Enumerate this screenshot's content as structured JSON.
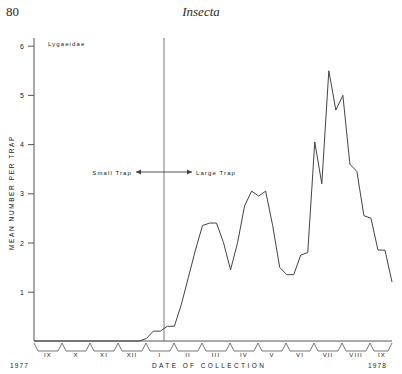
{
  "page": {
    "number": "80",
    "running_head": "Insecta"
  },
  "chart_data": {
    "type": "line",
    "title": "",
    "series_label": "Lygaeidae",
    "xlabel": "DATE OF COLLECTION",
    "ylabel": "MEAN NUMBER PER TRAP",
    "ylim": [
      0,
      6.3
    ],
    "y_ticks": [
      "1",
      "2",
      "3",
      "4",
      "5",
      "6"
    ],
    "y_tick_values": [
      1,
      2,
      3,
      4,
      5,
      6
    ],
    "grid": false,
    "legend_position": "none",
    "x_months": [
      "IX",
      "X",
      "XI",
      "XII",
      "I",
      "II",
      "III",
      "IV",
      "V",
      "VI",
      "VII",
      "VIII",
      "IX"
    ],
    "x_year_start": "1977",
    "x_year_end": "1978",
    "annotations": {
      "left_label": "Small Trap",
      "right_label": "Large Trap",
      "divider_month": "I"
    },
    "x": [
      0,
      1,
      2,
      3,
      4,
      5,
      6,
      7,
      8,
      9,
      10,
      11,
      12,
      13,
      14,
      15,
      16,
      17,
      18,
      19,
      20,
      21,
      22,
      23,
      24,
      25,
      26,
      27,
      28,
      29,
      30,
      31,
      32,
      33,
      34,
      35,
      36,
      37,
      38,
      39,
      40,
      41,
      42,
      43,
      44,
      45,
      46,
      47,
      48,
      49,
      50,
      51
    ],
    "values": [
      0.0,
      0.0,
      0.0,
      0.0,
      0.0,
      0.0,
      0.0,
      0.0,
      0.0,
      0.0,
      0.0,
      0.0,
      0.0,
      0.0,
      0.0,
      0.0,
      0.05,
      0.2,
      0.2,
      0.3,
      0.3,
      0.75,
      1.3,
      1.85,
      2.35,
      2.4,
      2.4,
      2.0,
      1.45,
      2.0,
      2.75,
      3.05,
      2.95,
      3.05,
      2.35,
      1.5,
      1.35,
      1.35,
      1.75,
      1.8,
      4.05,
      3.2,
      5.5,
      4.7,
      5.0,
      3.6,
      3.45,
      2.55,
      2.5,
      1.85,
      1.85,
      1.2
    ]
  }
}
